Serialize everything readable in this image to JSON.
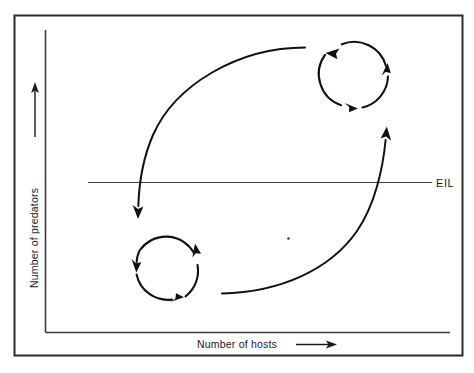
{
  "figure": {
    "name": "host-predator-population-cycle-diagram",
    "background_color": "#ffffff",
    "ink_color": "#1a1a1a",
    "border": {
      "name": "figure-border",
      "color": "#2b2b2b"
    },
    "axes": {
      "y_axis": {
        "label": "Number of predators",
        "name": "y-axis",
        "direction_arrow": "up-arrow"
      },
      "x_axis": {
        "label": "Number of hosts",
        "name": "x-axis",
        "direction_arrow": "right-arrow"
      }
    },
    "threshold_line": {
      "label": "EIL",
      "name": "economic-injury-level-line",
      "color": "#3c3c3c"
    },
    "cycles": [
      {
        "name": "upper-right-cycle",
        "position": "above-eil",
        "direction": "clockwise",
        "arrowheads": 3
      },
      {
        "name": "lower-left-cycle",
        "position": "below-eil",
        "direction": "clockwise",
        "arrowheads": 3
      }
    ],
    "transitions": [
      {
        "name": "descending-transition-arrow",
        "from": "upper-right-cycle",
        "to": "lower-left-cycle",
        "arrowhead": "down-arrow"
      },
      {
        "name": "ascending-transition-arrow",
        "from": "lower-left-cycle",
        "to": "upper-right-cycle",
        "arrowhead": "up-arrow"
      }
    ],
    "speck": {
      "name": "paper-speck-artifact"
    }
  }
}
